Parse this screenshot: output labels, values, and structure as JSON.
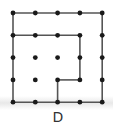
{
  "figure": {
    "label": "D",
    "grid": {
      "rows": 5,
      "cols": 5,
      "origin_x": 13,
      "origin_y": 13,
      "spacing": 22.3
    },
    "colors": {
      "line": "#555555",
      "dot": "#1a1a1a",
      "label": "#333333"
    },
    "segments": [
      {
        "from": [
          0,
          0
        ],
        "to": [
          4,
          0
        ]
      },
      {
        "from": [
          0,
          0
        ],
        "to": [
          0,
          4
        ]
      },
      {
        "from": [
          4,
          0
        ],
        "to": [
          4,
          4
        ]
      },
      {
        "from": [
          0,
          4
        ],
        "to": [
          4,
          4
        ]
      },
      {
        "from": [
          0,
          1
        ],
        "to": [
          3,
          1
        ]
      },
      {
        "from": [
          3,
          1
        ],
        "to": [
          3,
          3
        ]
      },
      {
        "from": [
          2,
          3
        ],
        "to": [
          3,
          3
        ]
      },
      {
        "from": [
          2,
          3
        ],
        "to": [
          2,
          4
        ]
      }
    ]
  }
}
